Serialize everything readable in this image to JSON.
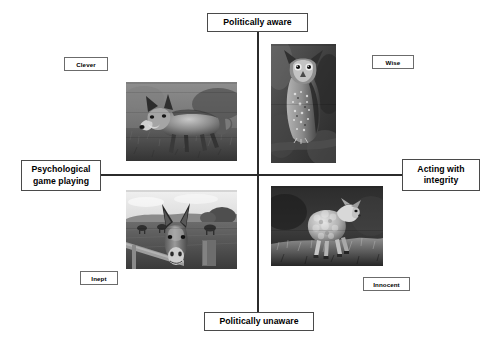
{
  "diagram": {
    "axes": {
      "vertical": {
        "top_label": "Politically aware",
        "bottom_label": "Politically unaware"
      },
      "horizontal": {
        "left_label_line1": "Psychological",
        "left_label_line2": "game playing",
        "right_label_line1": "Acting with",
        "right_label_line2": "integrity"
      }
    },
    "quadrants": [
      {
        "position": "top-left",
        "label": "Clever",
        "image": "fox-photo",
        "image_alt": "Fox walking in grass"
      },
      {
        "position": "top-right",
        "label": "Wise",
        "image": "owl-photo",
        "image_alt": "Great horned owl perched"
      },
      {
        "position": "bottom-left",
        "label": "Inept",
        "image": "donkey-photo",
        "image_alt": "Donkey at a fence in a field"
      },
      {
        "position": "bottom-right",
        "label": "Innocent",
        "image": "lamb-photo",
        "image_alt": "Lamb standing on grass"
      }
    ],
    "colors": {
      "background": "#ffffff",
      "axis_line": "#2b2b2b",
      "pole_box_border": "#4a4a4a",
      "quad_box_border": "#6b6b6b",
      "text": "#000000"
    }
  }
}
